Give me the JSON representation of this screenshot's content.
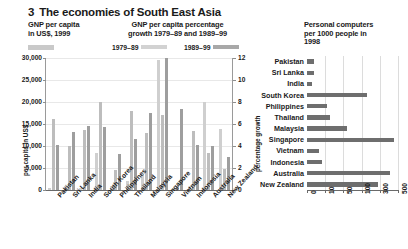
{
  "figure": {
    "number": "3",
    "title": "The economies of South East Asia"
  },
  "headers": {
    "left": "GNP per capita\nin US$, 1999",
    "left_line1": "GNP per capita",
    "left_line2": "in US$, 1999",
    "mid_line1": "GNP per capita percentage",
    "mid_line2": "growth 1979–89 and 1989–99",
    "right_line1": "Personal computers",
    "right_line2": "per 1000 people in",
    "right_line3": "1998"
  },
  "legend": {
    "series1_label": "1979–89",
    "series2_label": "1989–99",
    "series1_color": "#d2d2d2",
    "series2_color": "#a8a8a8",
    "gnp_color": "#cfcfcf"
  },
  "chart_data": [
    {
      "type": "bar",
      "id": "gnp-and-growth",
      "title": "GNP per capita in US$, 1999 and GNP per capita percentage growth 1979–89 and 1989–99",
      "categories": [
        "Pakistan",
        "Sri Lanka",
        "India",
        "South Korea",
        "Philippines",
        "Thailand",
        "Malaysia",
        "Singapore",
        "Vietnam",
        "Indonesia",
        "Australia",
        "New Zealand"
      ],
      "series": [
        {
          "name": "GNP per capita in US$, 1999",
          "axis": "left",
          "color": "#cfcfcf",
          "values": [
            470,
            820,
            450,
            8490,
            1020,
            1960,
            3390,
            29610,
            370,
            580,
            20050,
            13780
          ]
        },
        {
          "name": "1979–89",
          "axis": "right",
          "color": "#bdbdbd",
          "values": [
            6.5,
            4.0,
            5.5,
            8.0,
            1.8,
            7.2,
            5.2,
            6.8,
            0.4,
            5.4,
            3.4,
            1.9
          ]
        },
        {
          "name": "1989–99",
          "axis": "right",
          "color": "#9e9e9e",
          "values": [
            4.1,
            5.3,
            5.8,
            5.7,
            3.3,
            4.6,
            7.0,
            12.0,
            7.4,
            4.1,
            4.0,
            3.0
          ]
        }
      ],
      "ylabel_left": "per capita in US$",
      "ylabel_right": "percentage growth",
      "yticks_left": [
        "0",
        "5,000",
        "10,000",
        "15,000",
        "20,000",
        "25,000",
        "30,000"
      ],
      "yticks_right": [
        "0",
        "2",
        "4",
        "6",
        "8",
        "10",
        "12"
      ],
      "ylim_left": [
        0,
        30000
      ],
      "ylim_right": [
        0,
        12
      ],
      "grid": true,
      "legend_position": "top"
    },
    {
      "type": "bar",
      "id": "personal-computers",
      "orientation": "horizontal",
      "title": "Personal computers per 1000 people in 1998",
      "categories": [
        "Pakistan",
        "Sri Lanka",
        "India",
        "South Korea",
        "Philippines",
        "Thailand",
        "Malaysia",
        "Singapore",
        "Vietnam",
        "Indonesia",
        "Australia",
        "New Zealand"
      ],
      "values": [
        3.9,
        4.1,
        2.7,
        157,
        15,
        21.6,
        58.6,
        458,
        6.4,
        8.2,
        411,
        282
      ],
      "bar_color": "#6e6e6e",
      "xticks": [
        "0",
        "10",
        "50",
        "100",
        "300",
        "500"
      ],
      "xscale": "log-like",
      "grid": true
    }
  ]
}
